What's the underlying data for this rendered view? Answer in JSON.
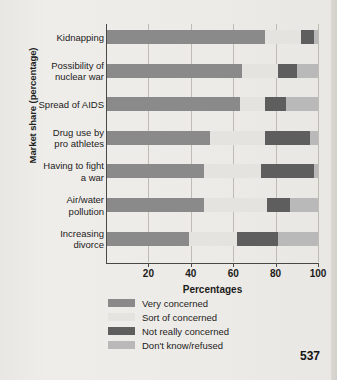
{
  "page_number": "537",
  "chart_data": {
    "type": "bar",
    "orientation": "horizontal",
    "stacked": true,
    "title": "",
    "xlabel": "Percentages",
    "ylabel": "Market share (percentage)",
    "xlim": [
      0,
      100
    ],
    "xticks": [
      20,
      40,
      60,
      80,
      100
    ],
    "grid": true,
    "legend_position": "below",
    "categories": [
      "Kidnapping",
      "Possibility of\nnuclear war",
      "Spread of AIDS",
      "Drug use by\npro athletes",
      "Having to fight\na war",
      "Air/water\npollution",
      "Increasing\ndivorce"
    ],
    "series": [
      {
        "name": "Very concerned",
        "color": "#8a8a8a",
        "values": [
          75,
          64,
          63,
          49,
          46,
          46,
          39
        ]
      },
      {
        "name": "Sort of concerned",
        "color": "#e4e3e0",
        "values": [
          17,
          17,
          12,
          26,
          27,
          30,
          23
        ]
      },
      {
        "name": "Not really concerned",
        "color": "#5e5e5e",
        "values": [
          6,
          9,
          10,
          21,
          25,
          11,
          19
        ]
      },
      {
        "name": "Don't know/refused",
        "color": "#b9b9b9",
        "values": [
          2,
          10,
          15,
          4,
          2,
          13,
          19
        ]
      }
    ]
  }
}
